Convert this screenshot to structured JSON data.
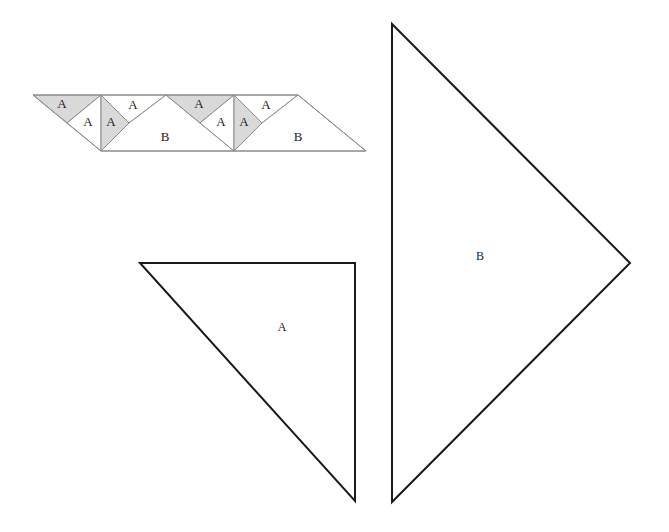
{
  "colors": {
    "shade": "#d9d9d9",
    "strip_stroke": "#8a8a8a",
    "big_stroke": "#1a1a1a",
    "background": "#ffffff"
  },
  "strip": {
    "labels": {
      "u1_top_shaded": "A",
      "u1_white_left": "A",
      "u1_shaded_right": "A",
      "u1_top_white": "A",
      "u1_big": "B",
      "u2_top_shaded": "A",
      "u2_white_left": "A",
      "u2_shaded_right": "A",
      "u2_top_white": "A",
      "u2_big": "B"
    }
  },
  "template_a": {
    "label": "A"
  },
  "template_b": {
    "label": "B"
  }
}
